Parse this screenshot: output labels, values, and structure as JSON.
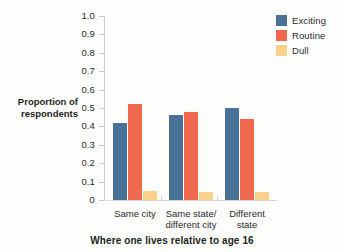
{
  "chart_data": {
    "type": "bar",
    "title": "",
    "subtitle": "",
    "xlabel": "Where one lives relative to age 16",
    "ylabel": "Proportion of respondents",
    "ylabel_line1": "Proportion of",
    "ylabel_line2": "respondents",
    "categories": [
      "Same city",
      "Same state/\ndifferent city",
      "Different\nstate"
    ],
    "category_labels_flat": [
      "Same city",
      "Same state/ different city",
      "Different state"
    ],
    "series": [
      {
        "name": "Exciting",
        "color": "#4a7297",
        "values": [
          0.42,
          0.46,
          0.5
        ]
      },
      {
        "name": "Routine",
        "color": "#f0694f",
        "values": [
          0.52,
          0.48,
          0.44
        ]
      },
      {
        "name": "Dull",
        "color": "#fbd08a",
        "values": [
          0.05,
          0.045,
          0.043
        ]
      }
    ],
    "ylim": [
      0,
      1.0
    ],
    "ytick_values": [
      0,
      0.1,
      0.2,
      0.3,
      0.4,
      0.5,
      0.6,
      0.7,
      0.8,
      0.9,
      1.0
    ],
    "ytick_labels": [
      "0",
      "0.1",
      "0.2",
      "0.3",
      "0.4",
      "0.5",
      "0.6",
      "0.7",
      "0.8",
      "0.9",
      "1.0"
    ],
    "grid": false,
    "legend_position": "top-right",
    "legend_entries": [
      "Exciting",
      "Routine",
      "Dull"
    ],
    "background_color": "#fdfdfc",
    "axis_color": "#c9c9c9"
  }
}
